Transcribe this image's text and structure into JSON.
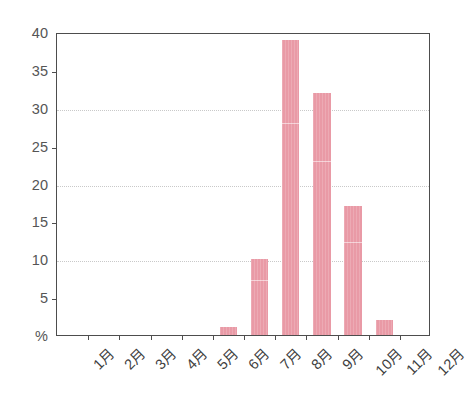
{
  "chart_data": {
    "type": "bar",
    "title": "",
    "subtitle": "",
    "xlabel": "",
    "ylabel": "%",
    "unit_label": "%",
    "categories": [
      "1月",
      "2月",
      "3月",
      "4月",
      "5月",
      "6月",
      "7月",
      "8月",
      "9月",
      "10月",
      "11月",
      "12月"
    ],
    "values": [
      0,
      0,
      0,
      0,
      0,
      1,
      10,
      39,
      32,
      17,
      2,
      0
    ],
    "ylim": [
      0,
      40
    ],
    "y_major_ticks": [
      0,
      10,
      20,
      30,
      40
    ],
    "y_minor_ticks": [
      5,
      15,
      25,
      35
    ],
    "y_tick_labels": [
      "%",
      "5",
      "10",
      "15",
      "20",
      "25",
      "30",
      "35",
      "40"
    ],
    "y_tick_values": [
      0,
      5,
      10,
      15,
      20,
      25,
      30,
      35,
      40
    ],
    "gridlines_at": [
      10,
      20,
      30
    ],
    "grid": true,
    "legend": false,
    "legend_position": "none",
    "bar_color": "#e99aa6",
    "axis_color": "#4d4d4d",
    "grid_color": "#c9c9c9",
    "text_color": "#555555",
    "background": "#ffffff",
    "annotations": []
  }
}
